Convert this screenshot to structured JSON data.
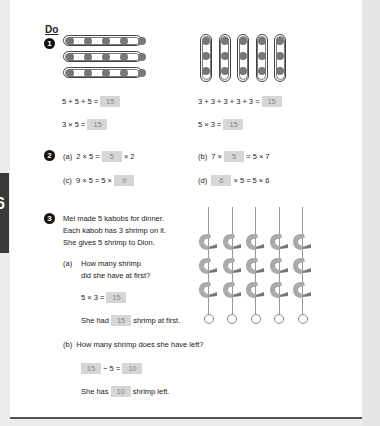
{
  "section_title": "Do",
  "side_tab": {
    "label": "6"
  },
  "problems": [
    {
      "number": "1",
      "left": {
        "figure": {
          "type": "horizontal-groups",
          "groups": 3,
          "dots_per_group": 5
        },
        "eq1": "5 + 5 + 5 =",
        "eq1_answer": "15",
        "eq2": "3 × 5 =",
        "eq2_answer": "15"
      },
      "right": {
        "figure": {
          "type": "vertical-groups",
          "groups": 5,
          "dots_per_group": 3
        },
        "eq1": "3 + 3 + 3 + 3 + 3 =",
        "eq1_answer": "15",
        "eq2": "5 × 3 =",
        "eq2_answer": "15"
      }
    },
    {
      "number": "2",
      "parts": [
        {
          "label": "(a)",
          "before": "2 × 5 =",
          "answer": "5",
          "after": "× 2"
        },
        {
          "label": "(b)",
          "before": "7 ×",
          "answer": "5",
          "after": "= 5 × 7"
        },
        {
          "label": "(c)",
          "before": "9 × 5 = 5 ×",
          "answer": "9",
          "after": ""
        },
        {
          "label": "(d)",
          "before": "",
          "answer": "6",
          "after": "× 5 = 5 × 6"
        }
      ]
    },
    {
      "number": "3",
      "story": [
        "Mei made 5 kabobs for dinner.",
        "Each kabob has 3 shrimp on it.",
        "She gives 5 shrimp to Dion."
      ],
      "figure": {
        "type": "kabobs",
        "kabobs": 5,
        "shrimp_per_kabob": 3
      },
      "part_a": {
        "label": "(a)",
        "question": [
          "How many shrimp",
          "did she have at first?"
        ],
        "eq_before": "5 × 3 =",
        "eq_answer": "15",
        "sentence_before": "She had",
        "sentence_answer": "15",
        "sentence_after": "shrimp at first."
      },
      "part_b": {
        "label": "(b)",
        "question": "How many shrimp does she have left?",
        "eq_answer1": "15",
        "eq_mid": "− 5 =",
        "eq_answer2": "10",
        "sentence_before": "She has",
        "sentence_answer": "10",
        "sentence_after": "shrimp left."
      }
    }
  ]
}
